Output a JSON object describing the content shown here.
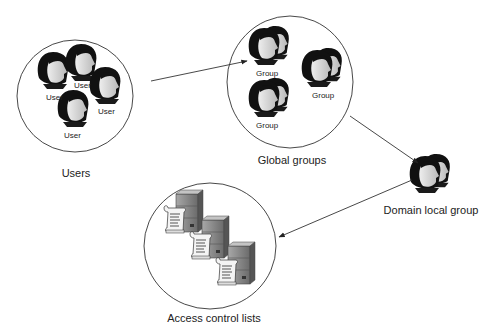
{
  "diagram": {
    "nodes": {
      "users": {
        "label": "Users",
        "members": [
          {
            "label": "User"
          },
          {
            "label": "User"
          },
          {
            "label": "User"
          },
          {
            "label": "User"
          }
        ]
      },
      "global_groups": {
        "label": "Global groups",
        "members": [
          {
            "label": "Group"
          },
          {
            "label": "Group"
          },
          {
            "label": "Group"
          }
        ]
      },
      "domain_local_group": {
        "label": "Domain local group"
      },
      "acls": {
        "label": "Access control lists",
        "members": [
          {
            "icon": "server-with-acl-scroll"
          },
          {
            "icon": "server-with-acl-scroll"
          },
          {
            "icon": "server-with-acl-scroll"
          }
        ]
      }
    },
    "edges": [
      {
        "from": "users",
        "to": "global_groups"
      },
      {
        "from": "global_groups",
        "to": "domain_local_group"
      },
      {
        "from": "domain_local_group",
        "to": "acls"
      }
    ],
    "colors": {
      "line": "#333333",
      "hair": "#111111",
      "skin": "#d8d8d8",
      "server": "#8a8a8a"
    }
  }
}
